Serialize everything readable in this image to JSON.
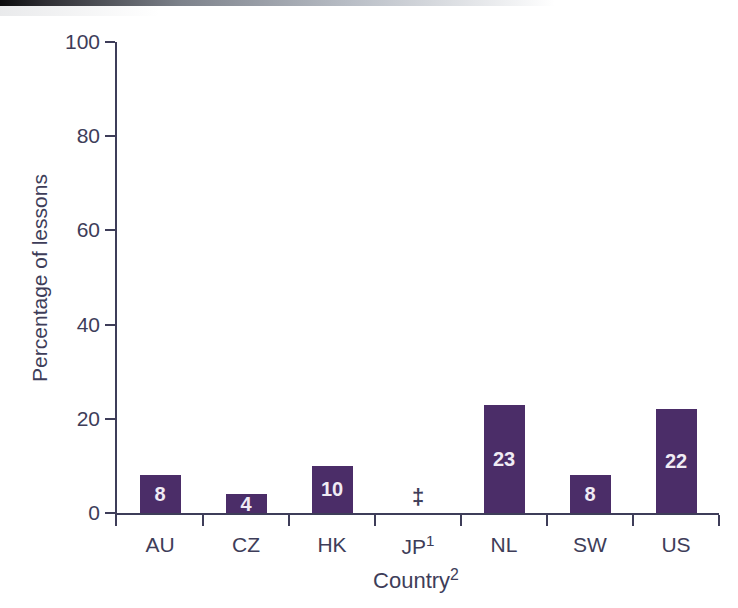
{
  "chart_data": {
    "type": "bar",
    "title": "",
    "xlabel": "Country",
    "xlabel_sup": "2",
    "ylabel": "Percentage of lessons",
    "ylim": [
      0,
      100
    ],
    "yticks": [
      0,
      20,
      40,
      60,
      80,
      100
    ],
    "grid": false,
    "legend": null,
    "categories": [
      "AU",
      "CZ",
      "HK",
      "JP",
      "NL",
      "SW",
      "US"
    ],
    "category_sups": [
      "",
      "",
      "",
      "1",
      "",
      "",
      ""
    ],
    "values": [
      8,
      4,
      10,
      null,
      23,
      8,
      22
    ],
    "value_labels": [
      "8",
      "4",
      "10",
      "‡",
      "23",
      "8",
      "22"
    ],
    "suppressed": {
      "category": "JP",
      "symbol": "‡"
    },
    "colors": {
      "bar": "#4b2d68",
      "bar_label": "#f0ebf4",
      "axis": "#3e3d59",
      "text": "#3e3d59",
      "page_edge": "#0b0b0d"
    }
  }
}
